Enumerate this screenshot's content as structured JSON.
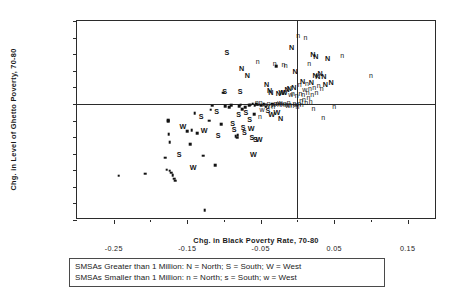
{
  "chart_data": {
    "type": "scatter",
    "title": "",
    "xlabel": "Chg. in Black Poverty Rate, 70-80",
    "ylabel": "Chg. in Level of Ghetto Poverty, 70-80",
    "xlim": [
      -0.3,
      0.19
    ],
    "ylim": [
      -0.7,
      0.5
    ],
    "xticks": [
      -0.25,
      -0.15,
      -0.05,
      0.05,
      0.15
    ],
    "xtick_labels": [
      "-0.25",
      "-0.15",
      "-0.05",
      "0.05",
      "0.15"
    ],
    "xminor_ticks": [
      -0.2,
      -0.1,
      0.0,
      0.1
    ],
    "yticks": [
      0.5,
      0.4,
      0.3,
      0.2,
      0.1,
      0.0,
      -0.1,
      -0.2,
      -0.3,
      -0.4,
      -0.5,
      -0.6,
      -0.7
    ],
    "ytick_labels": [
      "0.50",
      "0.40",
      "0.30",
      "0.20",
      "0.10",
      "0.00",
      "-0.10",
      "-0.20",
      "-0.30",
      "-0.40",
      "-0.50",
      "-0.60",
      "-0.70"
    ],
    "grid": false,
    "reference_lines": {
      "x": 0.0,
      "y": 0.0
    },
    "legend_position": "below-axes",
    "marker_encoding": {
      "N": "large SMSA, North",
      "S": "large SMSA, South",
      "W": "large SMSA, West",
      "n": "small SMSA, North",
      "s": "small SMSA, South",
      "w": "small SMSA, West"
    },
    "points": [
      {
        "x": -0.243,
        "y": -0.434,
        "m": "s"
      },
      {
        "x": -0.207,
        "y": -0.421,
        "m": "s"
      },
      {
        "x": -0.18,
        "y": -0.325,
        "m": "s"
      },
      {
        "x": -0.178,
        "y": -0.396,
        "m": "s"
      },
      {
        "x": -0.174,
        "y": -0.402,
        "m": "s"
      },
      {
        "x": -0.172,
        "y": -0.414,
        "m": "s"
      },
      {
        "x": -0.17,
        "y": -0.43,
        "m": "s"
      },
      {
        "x": -0.168,
        "y": -0.452,
        "m": "s"
      },
      {
        "x": -0.166,
        "y": -0.463,
        "m": "s"
      },
      {
        "x": -0.174,
        "y": -0.232,
        "m": "s"
      },
      {
        "x": -0.175,
        "y": -0.182,
        "m": "s"
      },
      {
        "x": -0.176,
        "y": -0.103,
        "m": "s"
      },
      {
        "x": -0.176,
        "y": -0.098,
        "m": "s"
      },
      {
        "x": -0.161,
        "y": -0.3,
        "m": "S"
      },
      {
        "x": -0.156,
        "y": -0.133,
        "m": "W"
      },
      {
        "x": -0.15,
        "y": -0.164,
        "m": "s"
      },
      {
        "x": -0.146,
        "y": -0.243,
        "m": "s"
      },
      {
        "x": -0.144,
        "y": -0.157,
        "m": "s"
      },
      {
        "x": -0.142,
        "y": -0.381,
        "m": "W"
      },
      {
        "x": -0.14,
        "y": -0.056,
        "m": "s"
      },
      {
        "x": -0.136,
        "y": -0.178,
        "m": "s"
      },
      {
        "x": -0.131,
        "y": -0.074,
        "m": "S"
      },
      {
        "x": -0.128,
        "y": -0.312,
        "m": "s"
      },
      {
        "x": -0.127,
        "y": -0.158,
        "m": "W"
      },
      {
        "x": -0.126,
        "y": -0.64,
        "m": "s"
      },
      {
        "x": -0.12,
        "y": -0.102,
        "m": "s"
      },
      {
        "x": -0.118,
        "y": -0.035,
        "m": "s"
      },
      {
        "x": -0.116,
        "y": -0.01,
        "m": "s"
      },
      {
        "x": -0.112,
        "y": -0.37,
        "m": "s"
      },
      {
        "x": -0.11,
        "y": -0.042,
        "m": "S"
      },
      {
        "x": -0.108,
        "y": -0.19,
        "m": "S"
      },
      {
        "x": -0.104,
        "y": -0.121,
        "m": "s"
      },
      {
        "x": -0.101,
        "y": 0.068,
        "m": "s"
      },
      {
        "x": -0.099,
        "y": 0.078,
        "m": "S"
      },
      {
        "x": -0.098,
        "y": -0.012,
        "m": "s"
      },
      {
        "x": -0.096,
        "y": 0.312,
        "m": "S"
      },
      {
        "x": -0.093,
        "y": -0.02,
        "m": "s"
      },
      {
        "x": -0.09,
        "y": -0.007,
        "m": "s"
      },
      {
        "x": -0.088,
        "y": -0.113,
        "m": "S"
      },
      {
        "x": -0.086,
        "y": -0.152,
        "m": "S"
      },
      {
        "x": -0.084,
        "y": -0.196,
        "m": "s"
      },
      {
        "x": -0.082,
        "y": -0.203,
        "m": "s"
      },
      {
        "x": -0.081,
        "y": -0.188,
        "m": "s"
      },
      {
        "x": -0.08,
        "y": -0.062,
        "m": "S"
      },
      {
        "x": -0.079,
        "y": -0.013,
        "m": "s"
      },
      {
        "x": -0.078,
        "y": 0.078,
        "m": "S"
      },
      {
        "x": -0.077,
        "y": -0.005,
        "m": "s"
      },
      {
        "x": -0.076,
        "y": 0.219,
        "m": "N"
      },
      {
        "x": -0.075,
        "y": -0.031,
        "m": "s"
      },
      {
        "x": -0.074,
        "y": -0.138,
        "m": "S"
      },
      {
        "x": -0.072,
        "y": -0.168,
        "m": "S"
      },
      {
        "x": -0.071,
        "y": -0.021,
        "m": "s"
      },
      {
        "x": -0.07,
        "y": -0.05,
        "m": "S"
      },
      {
        "x": -0.068,
        "y": 0.175,
        "m": "N"
      },
      {
        "x": -0.066,
        "y": -0.008,
        "m": "s"
      },
      {
        "x": -0.065,
        "y": -0.088,
        "m": "S"
      },
      {
        "x": -0.064,
        "y": -0.004,
        "m": "s"
      },
      {
        "x": -0.063,
        "y": -0.144,
        "m": "W"
      },
      {
        "x": -0.062,
        "y": -0.197,
        "m": "S"
      },
      {
        "x": -0.061,
        "y": 0.002,
        "m": "s"
      },
      {
        "x": -0.06,
        "y": -0.3,
        "m": "W"
      },
      {
        "x": -0.059,
        "y": -0.062,
        "m": "s"
      },
      {
        "x": -0.058,
        "y": -0.011,
        "m": "s"
      },
      {
        "x": -0.057,
        "y": -0.214,
        "m": "S"
      },
      {
        "x": -0.056,
        "y": 0.0,
        "m": "s"
      },
      {
        "x": -0.055,
        "y": 0.01,
        "m": "n"
      },
      {
        "x": -0.054,
        "y": 0.258,
        "m": "n"
      },
      {
        "x": -0.053,
        "y": -0.004,
        "m": "s"
      },
      {
        "x": -0.052,
        "y": -0.212,
        "m": "W"
      },
      {
        "x": -0.051,
        "y": -0.073,
        "m": "n"
      },
      {
        "x": -0.05,
        "y": 0.012,
        "m": "n"
      },
      {
        "x": -0.049,
        "y": -0.006,
        "m": "s"
      },
      {
        "x": -0.048,
        "y": -0.03,
        "m": "w"
      },
      {
        "x": -0.046,
        "y": -0.002,
        "m": "s"
      },
      {
        "x": -0.044,
        "y": 0.002,
        "m": "n"
      },
      {
        "x": -0.043,
        "y": -0.018,
        "m": "s"
      },
      {
        "x": -0.042,
        "y": 0.118,
        "m": "N"
      },
      {
        "x": -0.041,
        "y": -0.004,
        "m": "w"
      },
      {
        "x": -0.04,
        "y": -0.038,
        "m": "S"
      },
      {
        "x": -0.039,
        "y": 0.006,
        "m": "n"
      },
      {
        "x": -0.038,
        "y": 0.082,
        "m": "N"
      },
      {
        "x": -0.037,
        "y": -0.008,
        "m": "n"
      },
      {
        "x": -0.036,
        "y": 0.074,
        "m": "N"
      },
      {
        "x": -0.035,
        "y": -0.06,
        "m": "W"
      },
      {
        "x": -0.034,
        "y": 0.002,
        "m": "s"
      },
      {
        "x": -0.033,
        "y": -0.014,
        "m": "n"
      },
      {
        "x": -0.032,
        "y": 0.0,
        "m": "w"
      },
      {
        "x": -0.031,
        "y": 0.244,
        "m": "n"
      },
      {
        "x": -0.03,
        "y": 0.008,
        "m": "n"
      },
      {
        "x": -0.029,
        "y": 0.228,
        "m": "s"
      },
      {
        "x": -0.028,
        "y": -0.048,
        "m": "W"
      },
      {
        "x": -0.027,
        "y": 0.004,
        "m": "n"
      },
      {
        "x": -0.026,
        "y": 0.068,
        "m": "N"
      },
      {
        "x": -0.025,
        "y": -0.002,
        "m": "n"
      },
      {
        "x": -0.024,
        "y": 0.012,
        "m": "w"
      },
      {
        "x": -0.023,
        "y": -0.085,
        "m": "N"
      },
      {
        "x": -0.022,
        "y": 0.006,
        "m": "n"
      },
      {
        "x": -0.021,
        "y": 0.072,
        "m": "W"
      },
      {
        "x": -0.02,
        "y": -0.003,
        "m": "n"
      },
      {
        "x": -0.019,
        "y": 0.238,
        "m": "n"
      },
      {
        "x": -0.018,
        "y": 0.07,
        "m": "W"
      },
      {
        "x": -0.017,
        "y": 0.004,
        "m": "n"
      },
      {
        "x": -0.016,
        "y": 0.232,
        "m": "n"
      },
      {
        "x": -0.015,
        "y": 0.0,
        "m": "n"
      },
      {
        "x": -0.014,
        "y": 0.088,
        "m": "N"
      },
      {
        "x": -0.013,
        "y": -0.006,
        "m": "w"
      },
      {
        "x": -0.012,
        "y": 0.01,
        "m": "n"
      },
      {
        "x": -0.011,
        "y": 0.096,
        "m": "N"
      },
      {
        "x": -0.01,
        "y": 0.002,
        "m": "n"
      },
      {
        "x": -0.009,
        "y": 0.062,
        "m": "w"
      },
      {
        "x": -0.008,
        "y": 0.345,
        "m": "N"
      },
      {
        "x": -0.007,
        "y": -0.004,
        "m": "n"
      },
      {
        "x": -0.006,
        "y": 0.064,
        "m": "n"
      },
      {
        "x": -0.005,
        "y": 0.1,
        "m": "N"
      },
      {
        "x": -0.004,
        "y": 0.006,
        "m": "n"
      },
      {
        "x": -0.003,
        "y": 0.201,
        "m": "N"
      },
      {
        "x": -0.002,
        "y": 0.0,
        "m": "w"
      },
      {
        "x": -0.001,
        "y": 0.052,
        "m": "n"
      },
      {
        "x": 0.0,
        "y": -0.012,
        "m": "n"
      },
      {
        "x": 0.001,
        "y": 0.415,
        "m": "n"
      },
      {
        "x": 0.002,
        "y": 0.004,
        "m": "n"
      },
      {
        "x": 0.003,
        "y": 0.118,
        "m": "n"
      },
      {
        "x": 0.004,
        "y": 0.066,
        "m": "n"
      },
      {
        "x": 0.005,
        "y": 0.024,
        "m": "n"
      },
      {
        "x": 0.006,
        "y": 0.0,
        "m": "n"
      },
      {
        "x": 0.007,
        "y": 0.139,
        "m": "N"
      },
      {
        "x": 0.008,
        "y": 0.06,
        "m": "n"
      },
      {
        "x": 0.009,
        "y": 0.03,
        "m": "n"
      },
      {
        "x": 0.01,
        "y": 0.088,
        "m": "w"
      },
      {
        "x": 0.011,
        "y": 0.402,
        "m": "n"
      },
      {
        "x": 0.012,
        "y": 0.014,
        "m": "n"
      },
      {
        "x": 0.013,
        "y": 0.124,
        "m": "n"
      },
      {
        "x": 0.014,
        "y": 0.07,
        "m": "n"
      },
      {
        "x": 0.015,
        "y": 0.044,
        "m": "n"
      },
      {
        "x": 0.016,
        "y": 0.248,
        "m": "n"
      },
      {
        "x": 0.017,
        "y": 0.096,
        "m": "n"
      },
      {
        "x": 0.018,
        "y": 0.018,
        "m": "n"
      },
      {
        "x": 0.019,
        "y": 0.132,
        "m": "N"
      },
      {
        "x": 0.02,
        "y": 0.062,
        "m": "n"
      },
      {
        "x": 0.021,
        "y": 0.302,
        "m": "N"
      },
      {
        "x": 0.022,
        "y": -0.022,
        "m": "n"
      },
      {
        "x": 0.023,
        "y": 0.104,
        "m": "n"
      },
      {
        "x": 0.024,
        "y": 0.174,
        "m": "N"
      },
      {
        "x": 0.025,
        "y": 0.286,
        "m": "N"
      },
      {
        "x": 0.026,
        "y": 0.072,
        "m": "n"
      },
      {
        "x": 0.028,
        "y": 0.166,
        "m": "N"
      },
      {
        "x": 0.029,
        "y": 0.112,
        "m": "n"
      },
      {
        "x": 0.031,
        "y": 0.184,
        "m": "N"
      },
      {
        "x": 0.033,
        "y": 0.098,
        "m": "n"
      },
      {
        "x": 0.035,
        "y": -0.078,
        "m": "n"
      },
      {
        "x": 0.036,
        "y": 0.168,
        "m": "N"
      },
      {
        "x": 0.038,
        "y": 0.12,
        "m": "N"
      },
      {
        "x": 0.041,
        "y": 0.274,
        "m": "N"
      },
      {
        "x": 0.046,
        "y": 0.13,
        "m": "N"
      },
      {
        "x": 0.05,
        "y": -0.011,
        "m": "n"
      },
      {
        "x": 0.061,
        "y": 0.294,
        "m": "n"
      },
      {
        "x": 0.1,
        "y": 0.176,
        "m": "n"
      }
    ]
  },
  "legend": {
    "row1": "SMSAs Greater than 1 Million:  N = North; S = South; W = West",
    "row2": "SMSAs Smaller than 1 Million:  n = North; s = South; w = West"
  }
}
